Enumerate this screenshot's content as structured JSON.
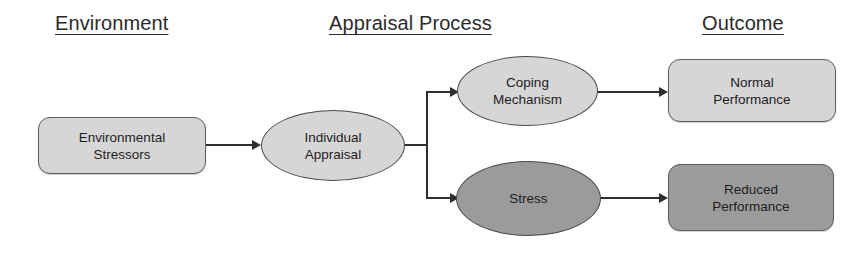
{
  "diagram": {
    "colors": {
      "fill_light": "#d6d6d6",
      "fill_dark": "#9b9b9b",
      "outline": "#4a4a4a",
      "connector": "#2e2e2e",
      "text": "#1d1d1d",
      "background": "#ffffff"
    },
    "headings": [
      {
        "id": "environment",
        "label": "Environment"
      },
      {
        "id": "appraisal_process",
        "label": "Appraisal Process"
      },
      {
        "id": "outcome",
        "label": "Outcome"
      }
    ],
    "nodes": [
      {
        "id": "environmental_stressors",
        "label": "Environmental\nStressors",
        "shape": "rounded-rect",
        "fill": "light",
        "column": "Environment"
      },
      {
        "id": "individual_appraisal",
        "label": "Individual\nAppraisal",
        "shape": "ellipse",
        "fill": "light",
        "column": "Appraisal Process"
      },
      {
        "id": "coping_mechanism",
        "label": "Coping\nMechanism",
        "shape": "ellipse",
        "fill": "light",
        "column": "Appraisal Process"
      },
      {
        "id": "stress",
        "label": "Stress",
        "shape": "ellipse",
        "fill": "dark",
        "column": "Appraisal Process"
      },
      {
        "id": "normal_performance",
        "label": "Normal\nPerformance",
        "shape": "rounded-rect",
        "fill": "light",
        "column": "Outcome"
      },
      {
        "id": "reduced_performance",
        "label": "Reduced\nPerformance",
        "shape": "rounded-rect",
        "fill": "dark",
        "column": "Outcome"
      }
    ],
    "edges": [
      {
        "id": "env_to_appraisal",
        "from": "environmental_stressors",
        "to": "individual_appraisal",
        "arrow": true
      },
      {
        "id": "appraisal_to_coping",
        "from": "individual_appraisal",
        "to": "coping_mechanism",
        "arrow": true
      },
      {
        "id": "appraisal_to_stress",
        "from": "individual_appraisal",
        "to": "stress",
        "arrow": true
      },
      {
        "id": "coping_to_normal",
        "from": "coping_mechanism",
        "to": "normal_performance",
        "arrow": true
      },
      {
        "id": "stress_to_reduced",
        "from": "stress",
        "to": "reduced_performance",
        "arrow": true
      }
    ]
  }
}
